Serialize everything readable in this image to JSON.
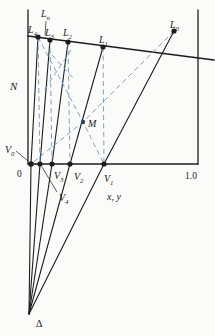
{
  "figure": {
    "background": "#fbfbf9",
    "ink_color": "#1c1c1c",
    "dash_color": "#7da0c8",
    "axes": {
      "y_axis_label": "N",
      "x_axis_label": "x, y",
      "origin_tick": "0",
      "max_tick": "1.0"
    },
    "solid_lines": [
      {
        "name": "n-axis",
        "w": 1.3,
        "pts": [
          [
            28,
            10
          ],
          [
            28,
            164
          ]
        ]
      },
      {
        "name": "x-axis",
        "w": 1.3,
        "pts": [
          [
            28,
            164
          ],
          [
            198,
            164
          ]
        ]
      },
      {
        "name": "right-border",
        "w": 1.3,
        "pts": [
          [
            198,
            10
          ],
          [
            198,
            164
          ]
        ]
      },
      {
        "name": "underflow-line",
        "w": 1.5,
        "pts": [
          [
            28,
            36
          ],
          [
            214,
            60
          ]
        ]
      },
      {
        "name": "operating-line-delta-v0-l4",
        "w": 1.1,
        "pts": [
          [
            29,
            314
          ],
          [
            31,
            164
          ],
          [
            38,
            37
          ]
        ]
      },
      {
        "name": "operating-line-delta-v4-l3",
        "w": 1.1,
        "pts": [
          [
            29,
            314
          ],
          [
            40,
            164
          ],
          [
            50,
            40
          ]
        ]
      },
      {
        "name": "operating-line-delta-v3-l2",
        "w": 1.1,
        "pts": [
          [
            29,
            314
          ],
          [
            52,
            164
          ],
          [
            68,
            42
          ]
        ]
      },
      {
        "name": "operating-line-delta-v2-l1",
        "w": 1.1,
        "pts": [
          [
            29,
            314
          ],
          [
            70,
            164
          ],
          [
            103,
            47
          ]
        ]
      },
      {
        "name": "operating-line-delta-v1-l0",
        "w": 1.1,
        "pts": [
          [
            29,
            314
          ],
          [
            104,
            164
          ],
          [
            174,
            31
          ]
        ]
      }
    ],
    "leader_lines": [
      {
        "name": "ln-leader",
        "pts": [
          [
            46,
            21
          ],
          [
            45,
            35
          ]
        ]
      },
      {
        "name": "v0-leader",
        "pts": [
          [
            16,
            151
          ],
          [
            28,
            161
          ]
        ]
      },
      {
        "name": "v4-leader",
        "pts": [
          [
            42,
            167
          ],
          [
            57,
            192
          ]
        ]
      }
    ],
    "dashed_lines": [
      {
        "name": "tie-line-l4-v4",
        "pts": [
          [
            38,
            37
          ],
          [
            40,
            164
          ]
        ]
      },
      {
        "name": "tie-line-l3-v3",
        "pts": [
          [
            50,
            40
          ],
          [
            52,
            164
          ]
        ]
      },
      {
        "name": "tie-line-l2-v2",
        "pts": [
          [
            68,
            42
          ],
          [
            70,
            164
          ]
        ]
      },
      {
        "name": "tie-line-l1-v1",
        "pts": [
          [
            103,
            47
          ],
          [
            104,
            164
          ]
        ]
      },
      {
        "name": "mixing-line-l0-m-v0",
        "pts": [
          [
            174,
            31
          ],
          [
            83,
            122
          ],
          [
            31,
            164
          ]
        ]
      },
      {
        "name": "mixing-line-l4-m-v1",
        "pts": [
          [
            38,
            37
          ],
          [
            83,
            122
          ],
          [
            104,
            164
          ]
        ]
      },
      {
        "name": "construction-dash-a",
        "pts": [
          [
            52,
            55
          ],
          [
            75,
            80
          ]
        ]
      },
      {
        "name": "construction-dash-b",
        "pts": [
          [
            71,
            50
          ],
          [
            43,
            92
          ]
        ]
      }
    ],
    "points": [
      {
        "name": "point-l4",
        "x": 38,
        "y": 37,
        "r": 2.6
      },
      {
        "name": "point-l3",
        "x": 50,
        "y": 40,
        "r": 2.6
      },
      {
        "name": "point-l2",
        "x": 68,
        "y": 42,
        "r": 2.6
      },
      {
        "name": "point-l1",
        "x": 103,
        "y": 47,
        "r": 2.6
      },
      {
        "name": "point-l0",
        "x": 174,
        "y": 31,
        "r": 2.6
      },
      {
        "name": "point-v0",
        "x": 31,
        "y": 164,
        "r": 2.8
      },
      {
        "name": "point-v4",
        "x": 40,
        "y": 164,
        "r": 2.6
      },
      {
        "name": "point-v3",
        "x": 52,
        "y": 164,
        "r": 2.6
      },
      {
        "name": "point-v2",
        "x": 70,
        "y": 164,
        "r": 2.6
      },
      {
        "name": "point-v1",
        "x": 104,
        "y": 164,
        "r": 2.6
      },
      {
        "name": "point-m",
        "x": 83,
        "y": 122,
        "r": 2.2,
        "color": "#2c3e66"
      }
    ],
    "labels": [
      {
        "name": "label-n",
        "text": "N",
        "sub": "",
        "x": 10,
        "y": 90,
        "size": 11,
        "italic": true
      },
      {
        "name": "label-ln",
        "text": "L",
        "sub": "n",
        "x": 41,
        "y": 17,
        "size": 10,
        "italic": true
      },
      {
        "name": "label-l4",
        "text": "L",
        "sub": "4",
        "x": 28,
        "y": 33,
        "size": 10,
        "italic": true
      },
      {
        "name": "label-l3",
        "text": "L",
        "sub": "3",
        "x": 45,
        "y": 36,
        "size": 10,
        "italic": true
      },
      {
        "name": "label-l2",
        "text": "L",
        "sub": "2",
        "x": 63,
        "y": 36,
        "size": 10,
        "italic": true
      },
      {
        "name": "label-l1",
        "text": "L",
        "sub": "1",
        "x": 99,
        "y": 43,
        "size": 10,
        "italic": true
      },
      {
        "name": "label-l0",
        "text": "L",
        "sub": "0",
        "x": 170,
        "y": 28,
        "size": 10,
        "italic": true
      },
      {
        "name": "label-m",
        "text": "M",
        "sub": "",
        "x": 88,
        "y": 127,
        "size": 10,
        "italic": true
      },
      {
        "name": "label-v0",
        "text": "V",
        "sub": "0",
        "x": 5,
        "y": 153,
        "size": 10,
        "italic": true
      },
      {
        "name": "label-zero",
        "text": "0",
        "sub": "",
        "x": 17,
        "y": 177,
        "size": 9.5,
        "italic": false
      },
      {
        "name": "label-v3",
        "text": "V",
        "sub": "3",
        "x": 54,
        "y": 179,
        "size": 10,
        "italic": true
      },
      {
        "name": "label-v2",
        "text": "V",
        "sub": "2",
        "x": 74,
        "y": 180,
        "size": 10,
        "italic": true
      },
      {
        "name": "label-v1",
        "text": "V",
        "sub": "1",
        "x": 104,
        "y": 182,
        "size": 10,
        "italic": true
      },
      {
        "name": "label-one",
        "text": "1.0",
        "sub": "",
        "x": 185,
        "y": 179,
        "size": 9.5,
        "italic": false
      },
      {
        "name": "label-v4",
        "text": "V",
        "sub": "4",
        "x": 59,
        "y": 201,
        "size": 10,
        "italic": true
      },
      {
        "name": "label-xy",
        "text": "x, y",
        "sub": "",
        "x": 107,
        "y": 200,
        "size": 10,
        "italic": true
      },
      {
        "name": "label-delta",
        "text": "Δ",
        "sub": "",
        "x": 36,
        "y": 327,
        "size": 10,
        "italic": false
      }
    ]
  }
}
